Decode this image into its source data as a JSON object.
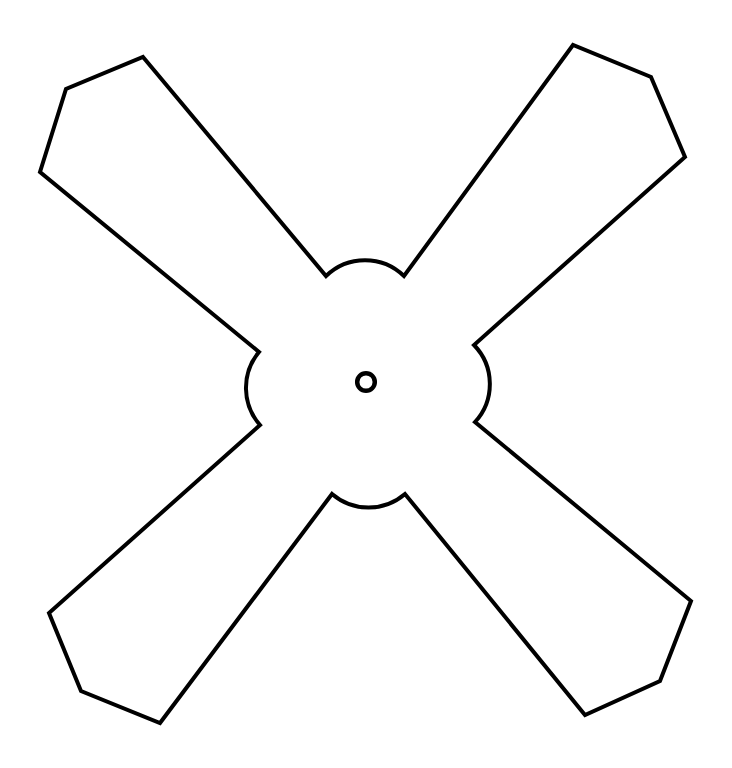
{
  "figure": {
    "title": "Four-blade fan / propeller outline",
    "domain": "Diagram",
    "canvas": {
      "width": 732,
      "height": 768,
      "background_color": "#ffffff"
    },
    "style": {
      "stroke_color": "#000000",
      "fill_color": "#ffffff",
      "stroke_width": 4,
      "stroke_linejoin": "miter",
      "stroke_linecap": "butt"
    },
    "shape": {
      "name": "four-blade-fan-outline",
      "description": "X-shaped four-blade fan silhouette with blunt hexagonal blade tips, concave arc fillets between adjacent blades, and a small circular hub bore at the center.",
      "blade_count": 4,
      "symmetry": "4-fold rotational about hub center",
      "center": {
        "x": 366,
        "y": 382
      },
      "hub_hole": {
        "name": "hub-bore",
        "cx": 366,
        "cy": 382,
        "outer_radius": 11,
        "inner_radius": 6.6,
        "stroke_width": 4.5
      },
      "blades": [
        {
          "name": "blade-top-left",
          "orientation": "upper-left",
          "tip_vertices": [
            {
              "x": 143,
              "y": 57
            },
            {
              "x": 66,
              "y": 89
            },
            {
              "x": 40,
              "y": 172
            }
          ],
          "root_points": [
            {
              "x": 326,
              "y": 276
            },
            {
              "x": 259,
              "y": 352
            }
          ]
        },
        {
          "name": "blade-top-right",
          "orientation": "upper-right",
          "tip_vertices": [
            {
              "x": 573,
              "y": 45
            },
            {
              "x": 651,
              "y": 77
            },
            {
              "x": 685,
              "y": 157
            }
          ],
          "root_points": [
            {
              "x": 404,
              "y": 276
            },
            {
              "x": 474,
              "y": 345
            }
          ]
        },
        {
          "name": "blade-bottom-right",
          "orientation": "lower-right",
          "tip_vertices": [
            {
              "x": 691,
              "y": 601
            },
            {
              "x": 660,
              "y": 681
            },
            {
              "x": 585,
              "y": 715
            }
          ],
          "root_points": [
            {
              "x": 475,
              "y": 422
            },
            {
              "x": 405,
              "y": 494
            }
          ]
        },
        {
          "name": "blade-bottom-left",
          "orientation": "lower-left",
          "tip_vertices": [
            {
              "x": 49,
              "y": 613
            },
            {
              "x": 81,
              "y": 691
            },
            {
              "x": 160,
              "y": 723
            }
          ],
          "root_points": [
            {
              "x": 332,
              "y": 494
            },
            {
              "x": 260,
              "y": 425
            }
          ]
        }
      ],
      "notch_arcs": [
        {
          "name": "notch-arc-top",
          "between": [
            "blade-top-left",
            "blade-top-right"
          ],
          "start": {
            "x": 326,
            "y": 276
          },
          "end": {
            "x": 404,
            "y": 276
          },
          "radius": 56,
          "sweep": "concave-toward-center",
          "apex": {
            "x": 365,
            "y": 267
          }
        },
        {
          "name": "notch-arc-right",
          "between": [
            "blade-top-right",
            "blade-bottom-right"
          ],
          "start": {
            "x": 474,
            "y": 345
          },
          "end": {
            "x": 475,
            "y": 422
          },
          "radius": 56,
          "sweep": "concave-toward-center",
          "apex": {
            "x": 482,
            "y": 383
          }
        },
        {
          "name": "notch-arc-bottom",
          "between": [
            "blade-bottom-right",
            "blade-bottom-left"
          ],
          "start": {
            "x": 405,
            "y": 494
          },
          "end": {
            "x": 332,
            "y": 494
          },
          "radius": 56,
          "sweep": "concave-toward-center",
          "apex": {
            "x": 368,
            "y": 499
          }
        },
        {
          "name": "notch-arc-left",
          "between": [
            "blade-bottom-left",
            "blade-top-left"
          ],
          "start": {
            "x": 260,
            "y": 425
          },
          "end": {
            "x": 259,
            "y": 352
          },
          "radius": 56,
          "sweep": "concave-toward-center",
          "apex": {
            "x": 252,
            "y": 388
          }
        }
      ],
      "path_d": "M 143 57 L 326 276 A 56 56 0 0 1 404 276 L 573 45 L 651 77 L 685 157 L 474 345 A 56 56 0 0 1 475 422 L 691 601 L 660 681 L 585 715 L 405 494 A 56 56 0 0 1 332 494 L 160 723 L 81 691 L 49 613 L 260 425 A 56 56 0 0 1 259 352 L 40 172 L 66 89 Z"
    }
  }
}
